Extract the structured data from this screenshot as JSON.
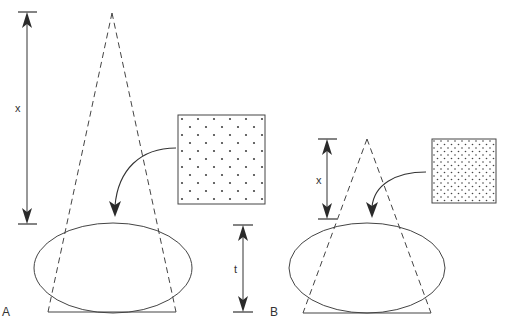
{
  "figure": {
    "panels": [
      {
        "id": "A",
        "label": "A",
        "distance_label": "x",
        "thickness_label": "t",
        "grid_description": "sparse staggered dot grid"
      },
      {
        "id": "B",
        "label": "B",
        "distance_label": "x",
        "grid_description": "dense staggered dot grid"
      }
    ]
  },
  "colors": {
    "stroke": "#3a3a3a",
    "dot": "#444444",
    "background": "#ffffff"
  }
}
